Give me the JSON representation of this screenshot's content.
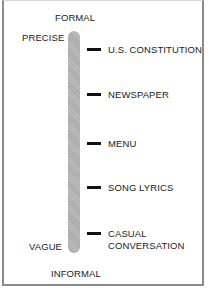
{
  "diagram": {
    "type": "vertical-scale",
    "top_axis_label": "FORMAL",
    "bottom_axis_label": "INFORMAL",
    "top_side_label": "PRECISE",
    "bottom_side_label": "VAGUE",
    "items": [
      {
        "label_lines": [
          "U.S. CONSTITUTION"
        ]
      },
      {
        "label_lines": [
          "NEWSPAPER"
        ]
      },
      {
        "label_lines": [
          "MENU"
        ]
      },
      {
        "label_lines": [
          "SONG LYRICS"
        ]
      },
      {
        "label_lines": [
          "CASUAL",
          "CONVERSATION"
        ]
      }
    ],
    "colors": {
      "bar": "#b3b3b3",
      "tick": "#111111",
      "border": "#8a8a8a",
      "text": "#1a1a1a"
    }
  }
}
